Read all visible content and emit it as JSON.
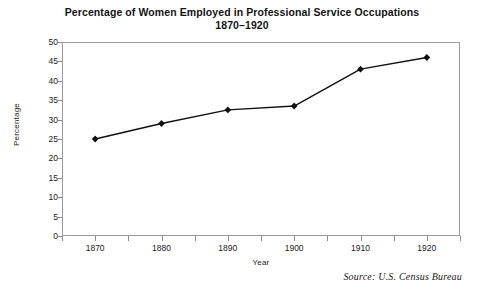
{
  "chart_data": {
    "type": "line",
    "title": "Percentage of Women Employed in Professional Service Occupations",
    "subtitle": "1870–1920",
    "xlabel": "Year",
    "ylabel": "Percentage",
    "categories": [
      "1870",
      "1880",
      "1890",
      "1900",
      "1910",
      "1920"
    ],
    "x": [
      1870,
      1880,
      1890,
      1900,
      1910,
      1920
    ],
    "values": [
      25,
      29,
      32.5,
      33.5,
      43,
      46
    ],
    "series": [
      {
        "name": "Percentage of Women Employed in Professional Service Occupations",
        "values": [
          25,
          29,
          32.5,
          33.5,
          43,
          46
        ]
      }
    ],
    "xlim": [
      1865,
      1925
    ],
    "ylim": [
      0,
      50
    ],
    "ytick_labels": [
      "50",
      "45",
      "40",
      "35",
      "30",
      "25",
      "20",
      "15",
      "10",
      "5",
      "0"
    ],
    "yticks": [
      50,
      45,
      40,
      35,
      30,
      25,
      20,
      15,
      10,
      5,
      0
    ],
    "xtick_labels": [
      "1870",
      "1880",
      "1890",
      "1900",
      "1910",
      "1920"
    ],
    "grid": false,
    "legend": "none",
    "marker": "diamond",
    "line_color": "#111111",
    "marker_color": "#111111",
    "frame_color": "#9a9a9a",
    "background": "#ffffff"
  },
  "annotations": {
    "source": "Source: U.S. Census Bureau"
  }
}
